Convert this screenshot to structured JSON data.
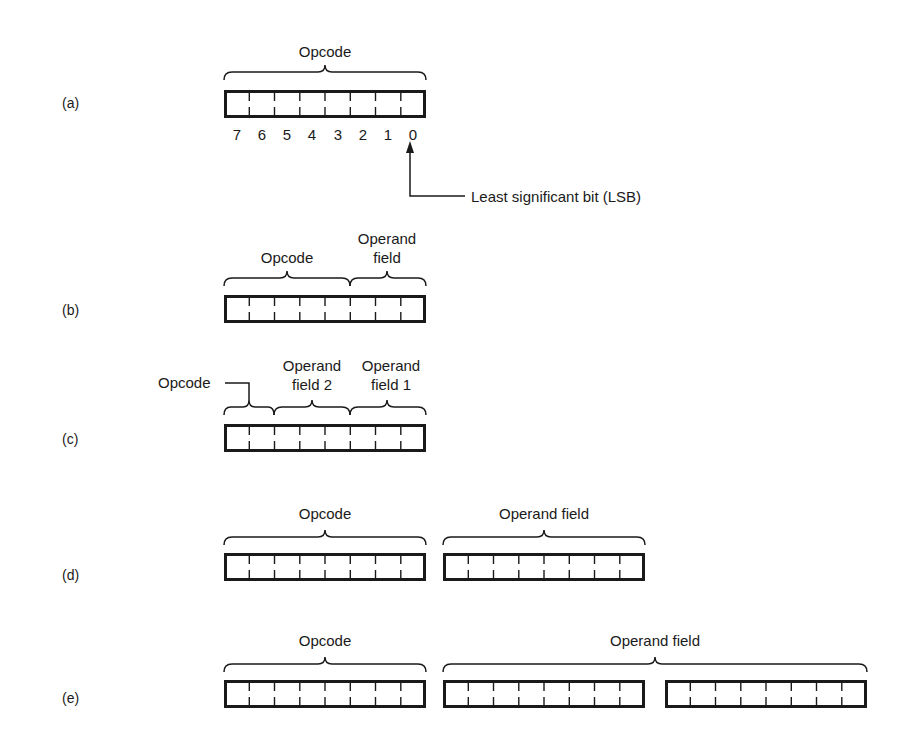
{
  "figure": {
    "parts": [
      {
        "id": "a",
        "label": "(a)",
        "fields": [
          {
            "name": "Opcode",
            "bits": 8
          }
        ],
        "bit_numbers": [
          "7",
          "6",
          "5",
          "4",
          "3",
          "2",
          "1",
          "0"
        ],
        "annotation": "Least significant bit (LSB)"
      },
      {
        "id": "b",
        "label": "(b)",
        "fields": [
          {
            "name": "Opcode",
            "bits": 5
          },
          {
            "name_line1": "Operand",
            "name_line2": "field",
            "bits": 3
          }
        ]
      },
      {
        "id": "c",
        "label": "(c)",
        "fields": [
          {
            "name": "Opcode",
            "bits": 2
          },
          {
            "name_line1": "Operand",
            "name_line2": "field 2",
            "bits": 3
          },
          {
            "name_line1": "Operand",
            "name_line2": "field 1",
            "bits": 3
          }
        ]
      },
      {
        "id": "d",
        "label": "(d)",
        "fields": [
          {
            "name": "Opcode",
            "bytes": 1
          },
          {
            "name": "Operand field",
            "bytes": 1
          }
        ]
      },
      {
        "id": "e",
        "label": "(e)",
        "fields": [
          {
            "name": "Opcode",
            "bytes": 1
          },
          {
            "name": "Operand field",
            "bytes": 2
          }
        ]
      }
    ]
  },
  "colors": {
    "ink": "#1a1a1a",
    "background": "#ffffff"
  }
}
